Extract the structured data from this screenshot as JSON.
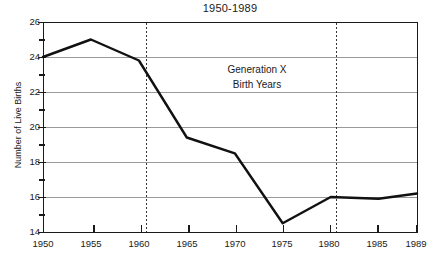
{
  "chart_data": {
    "type": "line",
    "title": "1950-1989",
    "xlabel": "",
    "ylabel": "Number of Live Births",
    "x": [
      1950,
      1955,
      1960,
      1965,
      1970,
      1975,
      1980,
      1985,
      1989
    ],
    "values": [
      24.0,
      25.0,
      23.8,
      19.4,
      18.5,
      14.5,
      16.0,
      15.9,
      16.2
    ],
    "series": [
      {
        "name": "Number of Live Births",
        "values": [
          24.0,
          25.0,
          23.8,
          19.4,
          18.5,
          14.5,
          16.0,
          15.9,
          16.2
        ]
      }
    ],
    "xlim": [
      1950,
      1989
    ],
    "ylim": [
      14,
      26
    ],
    "x_ticks": [
      1950,
      1955,
      1960,
      1965,
      1970,
      1975,
      1980,
      1985,
      1989
    ],
    "x_tick_labels": [
      "1950",
      "1955",
      "1960",
      "1965",
      "1970",
      "1975",
      "1980",
      "1985",
      "1989"
    ],
    "y_ticks": [
      14,
      16,
      18,
      20,
      22,
      24,
      26
    ],
    "y_tick_labels": [
      "14",
      "16",
      "18",
      "20",
      "22",
      "24",
      "26"
    ],
    "y_minor_ticks": [
      15,
      17,
      19,
      21,
      23,
      25
    ],
    "grid": "horizontal",
    "legend": "none",
    "line_color": "#000000",
    "grid_color": "#9a9a9a",
    "annotations": [
      {
        "name": "generation-x-label",
        "line1": "Generation X",
        "line2": "Birth Years",
        "x": 1970.5,
        "y": 22.8
      },
      {
        "name": "region-start-marker",
        "type": "vline",
        "x": 1961,
        "style": "dashed"
      },
      {
        "name": "region-end-marker",
        "type": "vline",
        "x": 1981,
        "style": "dashed"
      }
    ]
  },
  "chart": {
    "title": "1950-1989",
    "y_axis_title": "Number of Live Births",
    "y_tick_labels": [
      "26",
      "24",
      "22",
      "20",
      "18",
      "16",
      "14"
    ],
    "x_tick_labels": [
      "1950",
      "1955",
      "1960",
      "1965",
      "1970",
      "1975",
      "1980",
      "1985",
      "1989"
    ],
    "annotation": {
      "line1": "Generation X",
      "line2": "Birth Years"
    }
  }
}
